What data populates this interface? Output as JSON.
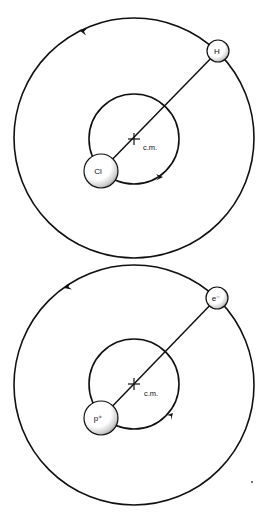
{
  "diagram": {
    "panels": [
      {
        "name": "hcl-molecule",
        "center_of_mass": {
          "label": "c.m.",
          "x": 134,
          "y": 139
        },
        "outer_orbit": {
          "cx": 134,
          "cy": 138,
          "r": 120,
          "direction": "counterclockwise"
        },
        "inner_orbit": {
          "cx": 134,
          "cy": 139,
          "r": 45,
          "direction": "counterclockwise"
        },
        "light_body": {
          "label": "H",
          "x": 218,
          "y": 51,
          "r": 11
        },
        "heavy_body": {
          "label": "Cl",
          "x": 101,
          "y": 171,
          "r": 17
        }
      },
      {
        "name": "hydrogen-atom",
        "center_of_mass": {
          "label": "c.m.",
          "x": 134,
          "y": 384
        },
        "outer_orbit": {
          "cx": 134,
          "cy": 385,
          "r": 120,
          "direction": "counterclockwise"
        },
        "inner_orbit": {
          "cx": 134,
          "cy": 384,
          "r": 45,
          "direction": "counterclockwise"
        },
        "light_body": {
          "label": "e⁻",
          "x": 217,
          "y": 298,
          "r": 11
        },
        "heavy_body": {
          "label": "p⁺",
          "x": 101,
          "y": 418,
          "r": 17
        }
      }
    ],
    "colors": {
      "line": "#111111",
      "background": "#ffffff",
      "atom_fill": "#ffffff",
      "atom_shade": "#9a9a9a"
    }
  }
}
